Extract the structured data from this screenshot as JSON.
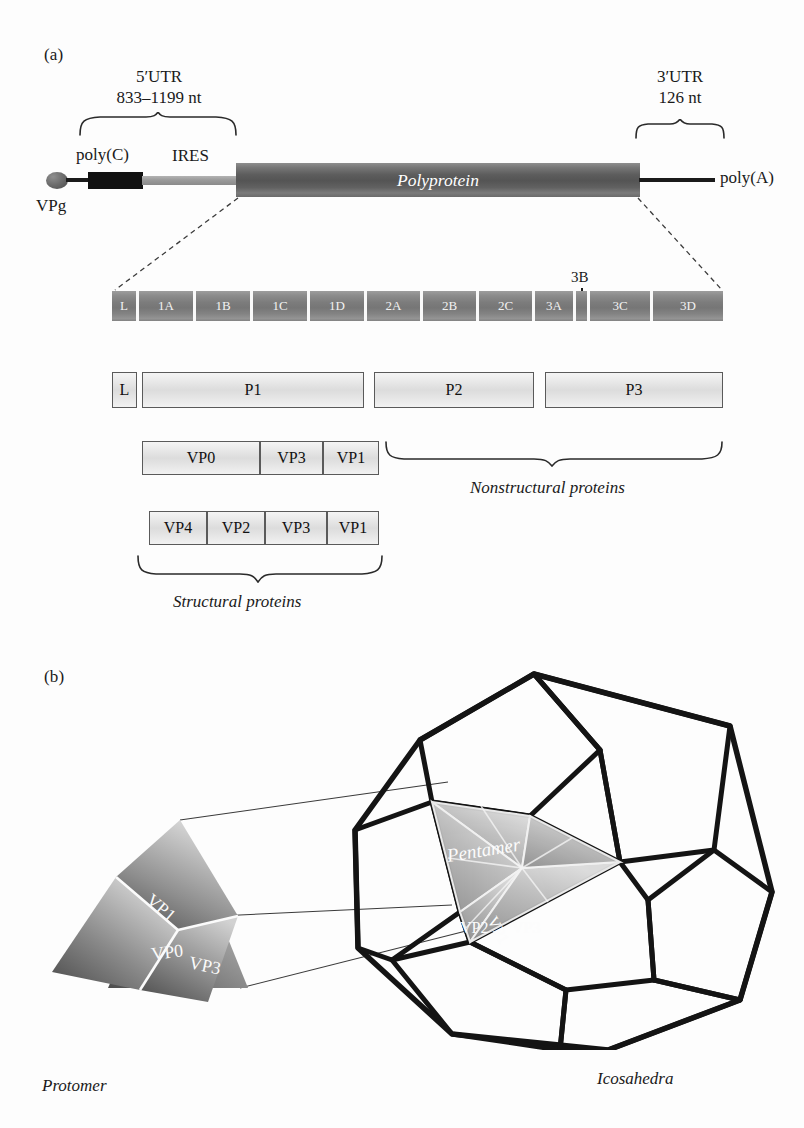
{
  "figure": {
    "panel_a_label": "(a)",
    "panel_b_label": "(b)"
  },
  "panel_a": {
    "utr5": {
      "title": "5′UTR",
      "length": "833–1199 nt"
    },
    "utr3": {
      "title": "3′UTR",
      "length": "126 nt"
    },
    "vpg_label": "VPg",
    "polyc_label": "poly(C)",
    "ires_label": "IRES",
    "polya_label": "poly(A)",
    "polyprotein_label": "Polyprotein",
    "gene_segments": [
      {
        "label": "L",
        "x": 112,
        "w": 24
      },
      {
        "label": "1A",
        "x": 139,
        "w": 54
      },
      {
        "label": "1B",
        "x": 196,
        "w": 54
      },
      {
        "label": "1C",
        "x": 253,
        "w": 54
      },
      {
        "label": "1D",
        "x": 310,
        "w": 54
      },
      {
        "label": "2A",
        "x": 367,
        "w": 53
      },
      {
        "label": "2B",
        "x": 423,
        "w": 53
      },
      {
        "label": "2C",
        "x": 479,
        "w": 53
      },
      {
        "label": "3A",
        "x": 535,
        "w": 38
      },
      {
        "label": "3B",
        "x": 576,
        "w": 11
      },
      {
        "label": "3C",
        "x": 590,
        "w": 60
      },
      {
        "label": "3D",
        "x": 653,
        "w": 70
      }
    ],
    "gene_3b_callout": "3B",
    "precursor_boxes": [
      {
        "label": "L",
        "x": 112,
        "w": 25
      },
      {
        "label": "P1",
        "x": 142,
        "w": 222
      },
      {
        "label": "P2",
        "x": 374,
        "w": 160
      },
      {
        "label": "P3",
        "x": 545,
        "w": 178
      }
    ],
    "p1_cleavage_row": [
      {
        "label": "VP0",
        "x": 142,
        "w": 118
      },
      {
        "label": "VP3",
        "x": 260,
        "w": 63
      },
      {
        "label": "VP1",
        "x": 323,
        "w": 56
      }
    ],
    "capsid_row": [
      {
        "label": "VP4",
        "x": 149,
        "w": 58
      },
      {
        "label": "VP2",
        "x": 207,
        "w": 58
      },
      {
        "label": "VP3",
        "x": 265,
        "w": 62
      },
      {
        "label": "VP1",
        "x": 327,
        "w": 52
      }
    ],
    "nonstructural_caption": "Nonstructural proteins",
    "structural_caption": "Structural proteins"
  },
  "panel_b": {
    "protomer_caption": "Protomer",
    "icosahedra_caption": "Icosahedra",
    "pentamer_label": "Pentamer",
    "protomer_faces": [
      {
        "name": "VP1",
        "label": "VP1"
      },
      {
        "name": "VP0",
        "label": "VP0"
      },
      {
        "name": "VP3",
        "label": "VP3"
      }
    ],
    "pentamer_faces": [
      {
        "name": "VP1",
        "label": "VP1"
      },
      {
        "name": "VP2",
        "label": "VP2"
      },
      {
        "name": "VP3",
        "label": "VP3"
      }
    ]
  },
  "colors": {
    "background": "#fdfdfd",
    "ink": "#1a1a1a",
    "genome_dark": "#545454",
    "gene_bar_gray": "#7c7c7c",
    "box_fill": "#e6e6e6",
    "box_stroke": "#5a5a5a",
    "cage_stroke": "#141414"
  }
}
